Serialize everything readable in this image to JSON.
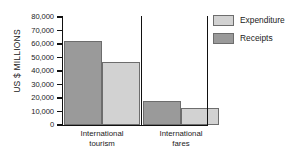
{
  "chart_data": {
    "type": "bar",
    "title": "",
    "xlabel": "",
    "ylabel": "US $ MILLIONS",
    "ylim": [
      0,
      80000
    ],
    "ytick_labels": [
      "80,000",
      "70,000",
      "60,000",
      "50,000",
      "40,000",
      "30,000",
      "20,000",
      "10,000",
      "0"
    ],
    "ytick_values": [
      80000,
      70000,
      60000,
      50000,
      40000,
      30000,
      20000,
      10000,
      0
    ],
    "categories": [
      "International\ntourism",
      "International\nfares"
    ],
    "grid": false,
    "legend_position": "right",
    "series": [
      {
        "name": "Receipts",
        "values": [
          62000,
          17500
        ],
        "color": "#9a9a9a"
      },
      {
        "name": "Expenditure",
        "values": [
          46500,
          12500
        ],
        "color": "#d2d2d2"
      }
    ]
  },
  "legend": {
    "entries": [
      {
        "label": "Expenditure",
        "swatch": "expenditure"
      },
      {
        "label": "Receipts",
        "swatch": "receipts"
      }
    ]
  }
}
